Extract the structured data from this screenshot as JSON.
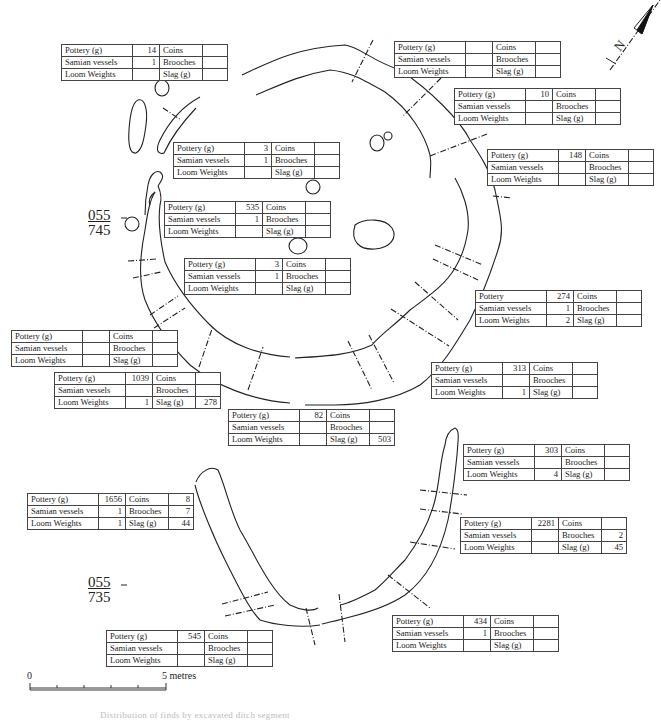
{
  "figure": {
    "type": "archaeological site plan",
    "caption": "Distribution of finds by excavated ditch segment"
  },
  "row_labels": {
    "pottery": "Pottery (g)",
    "pottery_alt": "Pottery",
    "samian": "Samian vessels",
    "loom": "Loom Weights",
    "coins": "Coins",
    "brooches": "Brooches",
    "slag": "Slag (g)"
  },
  "grid_refs": [
    {
      "top": "055",
      "bottom": "745"
    },
    {
      "top": "055",
      "bottom": "735"
    }
  ],
  "north_arrow": {
    "label": "N",
    "icon": "north-arrow-icon"
  },
  "scale_bar": {
    "start": "0",
    "end": "5 metres",
    "divisions": 5
  },
  "tables": [
    {
      "id": "t1",
      "pottery_label": "Pottery (g)",
      "pottery": "14",
      "samian": "1",
      "loom": "",
      "coins": "",
      "brooches": "",
      "slag": ""
    },
    {
      "id": "t2",
      "pottery_label": "Pottery (g)",
      "pottery": "",
      "samian": "",
      "loom": "",
      "coins": "",
      "brooches": "",
      "slag": ""
    },
    {
      "id": "t3",
      "pottery_label": "Pottery (g)",
      "pottery": "10",
      "samian": "",
      "loom": "",
      "coins": "",
      "brooches": "",
      "slag": ""
    },
    {
      "id": "t4",
      "pottery_label": "Pottery (g)",
      "pottery": "3",
      "samian": "1",
      "loom": "",
      "coins": "",
      "brooches": "",
      "slag": ""
    },
    {
      "id": "t5",
      "pottery_label": "Pottery (g)",
      "pottery": "148",
      "samian": "",
      "loom": "",
      "coins": "",
      "brooches": "",
      "slag": ""
    },
    {
      "id": "t6",
      "pottery_label": "Pottery (g)",
      "pottery": "535",
      "samian": "1",
      "loom": "",
      "coins": "",
      "brooches": "",
      "slag": ""
    },
    {
      "id": "t7",
      "pottery_label": "Pottery (g)",
      "pottery": "3",
      "samian": "1",
      "loom": "",
      "coins": "",
      "brooches": "",
      "slag": ""
    },
    {
      "id": "t8",
      "pottery_label": "Pottery",
      "pottery": "274",
      "samian": "1",
      "loom": "2",
      "coins": "",
      "brooches": "",
      "slag": ""
    },
    {
      "id": "t9",
      "pottery_label": "Pottery (g)",
      "pottery": "",
      "samian": "",
      "loom": "",
      "coins": "",
      "brooches": "",
      "slag": ""
    },
    {
      "id": "t10",
      "pottery_label": "Pottery (g)",
      "pottery": "1039",
      "samian": "",
      "loom": "1",
      "coins": "",
      "brooches": "",
      "slag": "278"
    },
    {
      "id": "t11",
      "pottery_label": "Pottery (g)",
      "pottery": "313",
      "samian": "",
      "loom": "1",
      "coins": "",
      "brooches": "",
      "slag": ""
    },
    {
      "id": "t12",
      "pottery_label": "Pottery (g)",
      "pottery": "82",
      "samian": "",
      "loom": "",
      "coins": "",
      "brooches": "",
      "slag": "503"
    },
    {
      "id": "t13",
      "pottery_label": "Pottery (g)",
      "pottery": "303",
      "samian": "",
      "loom": "4",
      "coins": "",
      "brooches": "",
      "slag": ""
    },
    {
      "id": "t14",
      "pottery_label": "Pottery (g)",
      "pottery": "1656",
      "samian": "1",
      "loom": "1",
      "coins": "8",
      "brooches": "7",
      "slag": "44"
    },
    {
      "id": "t15",
      "pottery_label": "Pottery (g)",
      "pottery": "2281",
      "samian": "",
      "loom": "",
      "coins": "",
      "brooches": "2",
      "slag": "45"
    },
    {
      "id": "t16",
      "pottery_label": "Pottery (g)",
      "pottery": "545",
      "samian": "",
      "loom": "",
      "coins": "",
      "brooches": "",
      "slag": ""
    },
    {
      "id": "t17",
      "pottery_label": "Pottery (g)",
      "pottery": "434",
      "samian": "1",
      "loom": "",
      "coins": "",
      "brooches": "",
      "slag": ""
    }
  ]
}
